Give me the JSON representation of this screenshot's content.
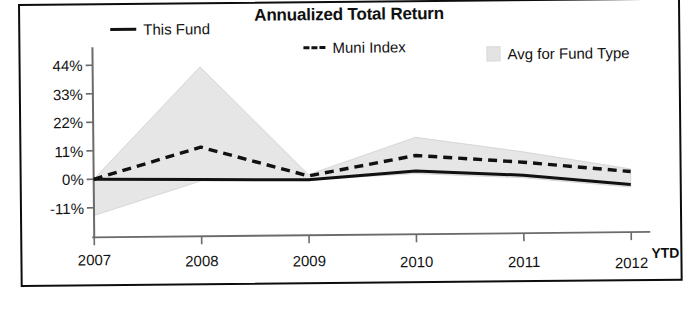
{
  "chart_data": {
    "type": "area",
    "title": "Annualized Total Return",
    "xlabel": "",
    "ylabel": "",
    "x": [
      "2007",
      "2008",
      "2009",
      "2010",
      "2011",
      "2012"
    ],
    "categories": [
      "2007",
      "2008",
      "2009",
      "2010",
      "2011",
      "2012"
    ],
    "x_suffix_label": "YTD",
    "ylim": [
      -17,
      47
    ],
    "yticks": [
      -11,
      0,
      11,
      22,
      33,
      44
    ],
    "ytick_labels": [
      "-11%",
      "0%",
      "11%",
      "22%",
      "33%",
      "44%"
    ],
    "grid": false,
    "legend_position": "top",
    "series": [
      {
        "name": "This Fund",
        "style": "solid",
        "color": "#111111",
        "values": [
          0,
          -0.5,
          -1,
          2,
          0,
          -4
        ]
      },
      {
        "name": "Muni Index",
        "style": "dashed",
        "color": "#111111",
        "values": [
          0,
          12,
          0.5,
          8,
          5,
          1
        ]
      },
      {
        "name": "Avg for Fund Type",
        "style": "band",
        "color": "#e6e6e6",
        "band_upper": [
          0,
          43,
          1,
          15,
          9,
          2
        ],
        "band_lower": [
          -14,
          -1,
          -1,
          1,
          -1,
          -5
        ]
      }
    ],
    "legend": [
      {
        "label": "This Fund",
        "marker": "solid-line",
        "color": "#111111"
      },
      {
        "label": "Muni Index",
        "marker": "dashed-line",
        "color": "#111111"
      },
      {
        "label": "Avg for Fund Type",
        "marker": "filled-square",
        "color": "#e3e3e3"
      }
    ]
  },
  "axes": {
    "y_ticks": [
      {
        "label": "44%",
        "value": 44
      },
      {
        "label": "33%",
        "value": 33
      },
      {
        "label": "22%",
        "value": 22
      },
      {
        "label": "11%",
        "value": 11
      },
      {
        "label": "0%",
        "value": 0
      },
      {
        "label": "-11%",
        "value": -11
      }
    ],
    "x_ticks": [
      {
        "label": "2007"
      },
      {
        "label": "2008"
      },
      {
        "label": "2009"
      },
      {
        "label": "2010"
      },
      {
        "label": "2011"
      },
      {
        "label": "2012"
      }
    ],
    "ytd": "YTD"
  },
  "colors": {
    "band": "#e6e6e6",
    "line": "#111111",
    "axis": "#6b6b6b",
    "frame": "#0d0d0d",
    "text": "#121212"
  }
}
